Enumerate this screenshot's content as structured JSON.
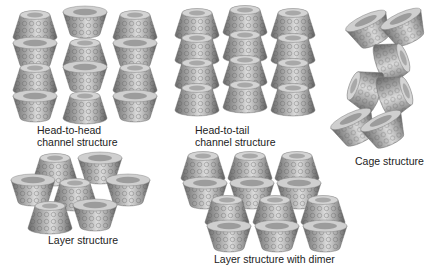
{
  "figure": {
    "panels": [
      {
        "id": "head-to-head",
        "label_line1": "Head-to-head",
        "label_line2": "channel structure"
      },
      {
        "id": "head-to-tail",
        "label_line1": "Head-to-tail",
        "label_line2": "channel structure"
      },
      {
        "id": "cage",
        "label_line1": "Cage structure"
      },
      {
        "id": "layer",
        "label_line1": "Layer structure"
      },
      {
        "id": "layer-dimer",
        "label_line1": "Layer structure with dimer"
      }
    ],
    "colors": {
      "background": "#ffffff",
      "outer_dark": "#6e6e6e",
      "outer_mid": "#9a9a9a",
      "rim_light": "#d6d6d6",
      "inner_light": "#ededed",
      "text": "#222222"
    }
  }
}
